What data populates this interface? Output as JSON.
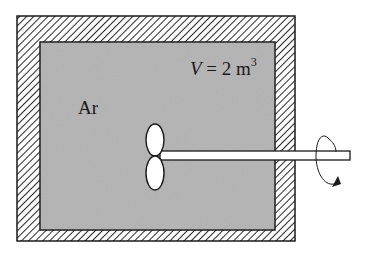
{
  "diagram": {
    "gas_label": "Ar",
    "volume": {
      "variable": "V",
      "equals": " = 2 m",
      "exponent": "3"
    },
    "colors": {
      "gas_fill": "#b3b3b3",
      "wall_hatch": "#2a2a2a",
      "wall_background": "#ffffff",
      "outline": "#1a1a1a",
      "paddle_fill": "#ffffff"
    },
    "components": [
      "insulated-wall",
      "argon-gas",
      "paddle-wheel",
      "rotating-shaft",
      "rotation-arrow"
    ]
  }
}
